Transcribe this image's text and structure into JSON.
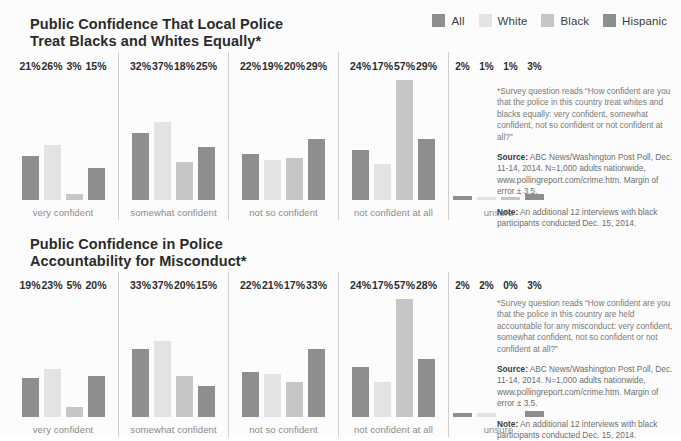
{
  "legend": {
    "items": [
      {
        "label": "All",
        "color": "#8e8e8e"
      },
      {
        "label": "White",
        "color": "#e3e3e3"
      },
      {
        "label": "Black",
        "color": "#c6c6c6"
      },
      {
        "label": "Hispanic",
        "color": "#8e8e8e"
      }
    ]
  },
  "charts": [
    {
      "title": "Public Confidence That Local Police\nTreat Blacks and Whites Equally*",
      "notes": {
        "question": "*Survey question reads “How confident are you that the police in this country treat whites and blacks equally: very confident, somewhat confident, not so confident or not confident at all?”",
        "source_label": "Source:",
        "source_text": " ABC News/Washington Post Poll, Dec. 11-14, 2014. N=1,000 adults nationwide, www.pollingreport.com/crime.htm. Margin of error ± 3.5.",
        "note_label": "Note:",
        "note_text": " An additional 12 interviews with black participants conducted Dec. 15, 2014."
      },
      "chart_data": {
        "type": "bar",
        "title": "Public Confidence That Local Police Treat Blacks and Whites Equally*",
        "xlabel": "",
        "ylabel": "",
        "ylim": [
          0,
          60
        ],
        "grid": false,
        "legend_position": "top-right",
        "categories": [
          "very confident",
          "somewhat confident",
          "not so confident",
          "not confident at all",
          "unsure"
        ],
        "series": [
          {
            "name": "All",
            "color": "#8e8e8e",
            "values": [
              21,
              32,
              22,
              24,
              2
            ]
          },
          {
            "name": "White",
            "color": "#e3e3e3",
            "values": [
              26,
              37,
              19,
              17,
              1
            ]
          },
          {
            "name": "Black",
            "color": "#c6c6c6",
            "values": [
              3,
              18,
              20,
              57,
              1
            ]
          },
          {
            "name": "Hispanic",
            "color": "#8e8e8e",
            "values": [
              15,
              25,
              29,
              29,
              3
            ]
          }
        ],
        "value_labels": [
          [
            "21%",
            "26%",
            "3%",
            "15%"
          ],
          [
            "32%",
            "37%",
            "18%",
            "25%"
          ],
          [
            "22%",
            "19%",
            "20%",
            "29%"
          ],
          [
            "24%",
            "17%",
            "57%",
            "29%"
          ],
          [
            "2%",
            "1%",
            "1%",
            "3%"
          ]
        ]
      }
    },
    {
      "title": "Public Confidence in Police\nAccountability for Misconduct*",
      "notes": {
        "question": "*Survey question reads “How confident are you that the police in this country are held accountable for any misconduct: very confident, somewhat confident, not so confident or not confident at all?”",
        "source_label": "Source:",
        "source_text": " ABC News/Washington Post Poll, Dec. 11-14, 2014. N=1,000 adults nationwide, www.pollingreport.com/crime.htm. Margin of error ± 3.5.",
        "note_label": "Note:",
        "note_text": " An additional 12 interviews with black participants conducted Dec. 15, 2014."
      },
      "chart_data": {
        "type": "bar",
        "title": "Public Confidence in Police Accountability for Misconduct*",
        "xlabel": "",
        "ylabel": "",
        "ylim": [
          0,
          60
        ],
        "grid": false,
        "legend_position": "top-right",
        "categories": [
          "very confident",
          "somewhat confident",
          "not so confident",
          "not confident at all",
          "unsure"
        ],
        "series": [
          {
            "name": "All",
            "color": "#8e8e8e",
            "values": [
              19,
              33,
              22,
              24,
              2
            ]
          },
          {
            "name": "White",
            "color": "#e3e3e3",
            "values": [
              23,
              37,
              21,
              17,
              2
            ]
          },
          {
            "name": "Black",
            "color": "#c6c6c6",
            "values": [
              5,
              20,
              17,
              57,
              0
            ]
          },
          {
            "name": "Hispanic",
            "color": "#8e8e8e",
            "values": [
              20,
              15,
              33,
              28,
              3
            ]
          }
        ],
        "value_labels": [
          [
            "19%",
            "23%",
            "5%",
            "20%"
          ],
          [
            "33%",
            "37%",
            "20%",
            "15%"
          ],
          [
            "22%",
            "21%",
            "17%",
            "33%"
          ],
          [
            "24%",
            "17%",
            "57%",
            "28%"
          ],
          [
            "2%",
            "2%",
            "0%",
            "3%"
          ]
        ]
      }
    }
  ]
}
